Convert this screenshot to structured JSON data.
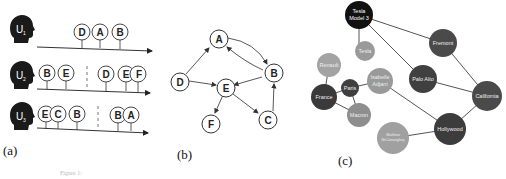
{
  "panel_a": {
    "caption": "(a)",
    "users": [
      {
        "label": "U",
        "sub": "1",
        "groups": [
          [
            "D",
            "A",
            "B"
          ]
        ]
      },
      {
        "label": "U",
        "sub": "2",
        "groups": [
          [
            "B",
            "E"
          ],
          [
            "D",
            "E",
            "F"
          ]
        ]
      },
      {
        "label": "U",
        "sub": "3",
        "groups": [
          [
            "E",
            "C",
            "B"
          ],
          [
            "B",
            "A"
          ]
        ]
      }
    ]
  },
  "panel_b": {
    "caption": "(b)",
    "nodes": [
      "A",
      "B",
      "C",
      "D",
      "E",
      "F"
    ],
    "edges": [
      [
        "D",
        "A"
      ],
      [
        "A",
        "B"
      ],
      [
        "B",
        "A"
      ],
      [
        "D",
        "E"
      ],
      [
        "B",
        "E"
      ],
      [
        "E",
        "F"
      ],
      [
        "E",
        "C"
      ],
      [
        "C",
        "B"
      ]
    ]
  },
  "panel_c": {
    "caption": "(c)",
    "nodes": [
      {
        "id": "tesla_model3",
        "line1": "Tesla",
        "line2": "Model 3",
        "color": "#111111"
      },
      {
        "id": "tesla",
        "line1": "Tesla",
        "color": "#9a9a9a"
      },
      {
        "id": "fremont",
        "line1": "Fremont",
        "color": "#4a4a4a"
      },
      {
        "id": "renault",
        "line1": "Renault",
        "color": "#a3a3a3"
      },
      {
        "id": "paris",
        "line1": "Paris",
        "color": "#3f3f3f"
      },
      {
        "id": "isabelle",
        "line1": "Isabelle",
        "line2": "Adjani",
        "color": "#9a9a9a"
      },
      {
        "id": "palo_alto",
        "line1": "Palo Alto",
        "color": "#404040"
      },
      {
        "id": "france",
        "line1": "France",
        "color": "#3a3a3a"
      },
      {
        "id": "california",
        "line1": "California",
        "color": "#4a4a4a"
      },
      {
        "id": "macron",
        "line1": "Macron",
        "color": "#8e8e8e"
      },
      {
        "id": "matthew",
        "line1": "Matthew",
        "line2": "McConaughey",
        "color": "#a0a0a0"
      },
      {
        "id": "hollywood",
        "line1": "Hollywood",
        "color": "#3c3c3c"
      }
    ]
  },
  "footer": {
    "faint_caption": "Figure 1:"
  }
}
